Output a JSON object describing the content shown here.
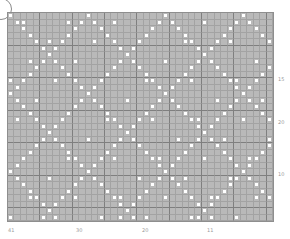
{
  "chart": {
    "type": "knitting-chart",
    "columns": 41,
    "rows": 32,
    "background_color": "#b9b9b9",
    "dot_color": "#ffffff",
    "major_line_every": 5
  },
  "bottom_labels": [
    {
      "text": "41",
      "x": 8
    },
    {
      "text": "30",
      "x": 76
    },
    {
      "text": "20",
      "x": 142
    },
    {
      "text": "11",
      "x": 207
    }
  ],
  "right_labels": [
    {
      "text": "15",
      "y": 77
    },
    {
      "text": "20",
      "y": 120
    },
    {
      "text": "10",
      "y": 172
    }
  ]
}
